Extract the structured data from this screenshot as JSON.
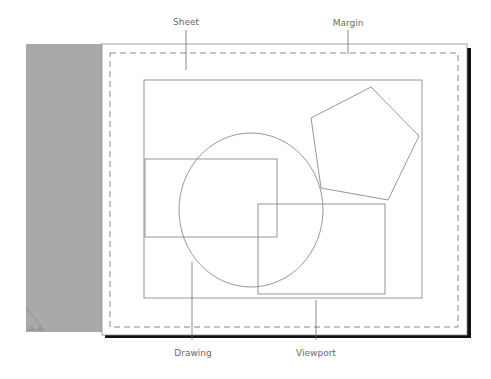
{
  "diagram": {
    "labels": {
      "sheet": "Sheet",
      "margin": "Margin",
      "drawing": "Drawing",
      "viewport": "Viewport"
    },
    "colors": {
      "background_panel": "#a9a9a9",
      "sheet_fill": "#ffffff",
      "sheet_border": "#8a8a8a",
      "shadow": "#111111",
      "margin_dash": "#7a7a7a",
      "shape_stroke": "#7d7d7d",
      "leader_line": "#6a6a6a",
      "label_text": "#6a6a6a"
    },
    "shapes": [
      "drawing-rectangle",
      "circle",
      "pentagon",
      "rectangle-left",
      "rectangle-right"
    ]
  }
}
